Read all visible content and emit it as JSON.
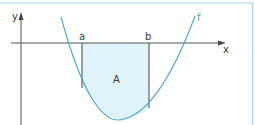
{
  "figure": {
    "type": "integral-area-diagram",
    "labels": {
      "y_axis": "y",
      "x_axis": "x",
      "function": "f",
      "lower_bound": "a",
      "upper_bound": "b",
      "area": "A"
    },
    "colors": {
      "frame": "#9fd6ea",
      "curve": "#4aa6cf",
      "fill": "#dff4fa",
      "axes": "#555555",
      "text": "#3a3a3a"
    }
  }
}
